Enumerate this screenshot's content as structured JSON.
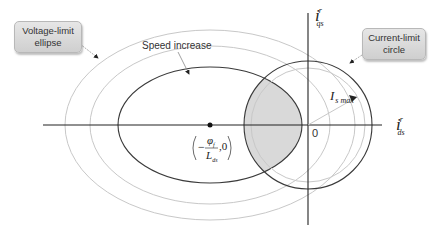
{
  "diagram": {
    "callouts": {
      "voltage_limit": {
        "line1": "Voltage-limit",
        "line2": "ellipse"
      },
      "current_limit": {
        "line1": "Current-limit",
        "line2": "circle"
      }
    },
    "annotations": {
      "speed_increase": "Speed increase",
      "origin": "0",
      "ellipse_center_num": "φ",
      "ellipse_center_num_sub": "f",
      "ellipse_center_den": "L",
      "ellipse_center_den_sub": "ds",
      "ellipse_center_minus": "−",
      "ellipse_center_tail": ",0",
      "radius_label": "I",
      "radius_label_sub": "s max"
    },
    "axes": {
      "x": {
        "symbol": "i",
        "superscript": "r",
        "subscript": "ds"
      },
      "y": {
        "symbol": "i",
        "superscript": "r",
        "subscript": "qs"
      }
    },
    "shapes": {
      "voltage_ellipses": [
        {
          "cx": 210,
          "cy": 125,
          "rx": 145,
          "ry": 95,
          "stroke": "#c8c8c8"
        },
        {
          "cx": 210,
          "cy": 125,
          "rx": 120,
          "ry": 79,
          "stroke": "#c8c8c8"
        },
        {
          "cx": 210,
          "cy": 125,
          "rx": 92,
          "ry": 58,
          "stroke": "#3a3a3a"
        }
      ],
      "current_circles": [
        {
          "cx": 308,
          "cy": 125,
          "r": 64,
          "stroke": "#3a3a3a"
        },
        {
          "cx": 308,
          "cy": 125,
          "r": 57,
          "stroke": "#c8c8c8"
        }
      ],
      "feasible_region_fill": "#d9d9d9"
    },
    "colors": {
      "axis": "#222222",
      "dark_curve": "#3a3a3a",
      "light_curve": "#c8c8c8",
      "callout_fill": "#dcdcdc"
    }
  }
}
